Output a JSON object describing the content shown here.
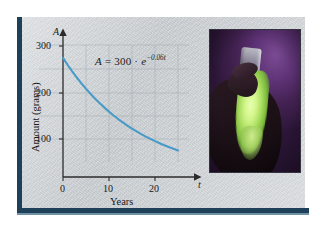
{
  "figure": {
    "caption_equation": "A = 300 · e^(-0.06t)",
    "panel_bg_color": "#c9ced2",
    "border_color": "#1e4159",
    "curve_color": "#4a9ac8"
  },
  "equation": {
    "lhs": "A",
    "equals": "=",
    "coefficient": "300",
    "dot": "·",
    "base": "e",
    "exponent": "−0.06t"
  },
  "chart_data": {
    "type": "line",
    "title": "",
    "xlabel": "Years",
    "ylabel": "Amount (grams)",
    "x_axis_var": "t",
    "y_axis_var": "A",
    "xlim": [
      0,
      26
    ],
    "ylim": [
      0,
      330
    ],
    "xticks": [
      0,
      10,
      20
    ],
    "xtick_labels": [
      "0",
      "10",
      "20"
    ],
    "yticks": [
      100,
      200,
      300
    ],
    "ytick_labels": [
      "100",
      "200",
      "300"
    ],
    "grid": true,
    "legend": "none",
    "annotations": [
      "A = 300 · e^-0.06t"
    ],
    "series": [
      {
        "name": "A(t) = 300e^(-0.06t)",
        "color": "#4a9ac8",
        "x": [
          0,
          1,
          2,
          3,
          4,
          5,
          6,
          7,
          8,
          9,
          10,
          11,
          12,
          13,
          14,
          15,
          16,
          17,
          18,
          19,
          20,
          21,
          22,
          23,
          24,
          25
        ],
        "y": [
          300,
          282.5,
          266.1,
          250.6,
          236.0,
          222.2,
          209.3,
          197.1,
          185.6,
          174.8,
          164.6,
          155.0,
          146.0,
          137.5,
          129.5,
          121.9,
          114.8,
          108.1,
          101.8,
          95.9,
          90.3,
          85.1,
          80.1,
          75.4,
          71.0,
          66.9
        ]
      }
    ]
  },
  "photo": {
    "alt_name": "glowing-test-tube-photo",
    "description": "A gloved hand holding a glowing green luminescent test tube against a purple background",
    "background_color": "#4b2760",
    "glow_color": "#bfe87a"
  }
}
